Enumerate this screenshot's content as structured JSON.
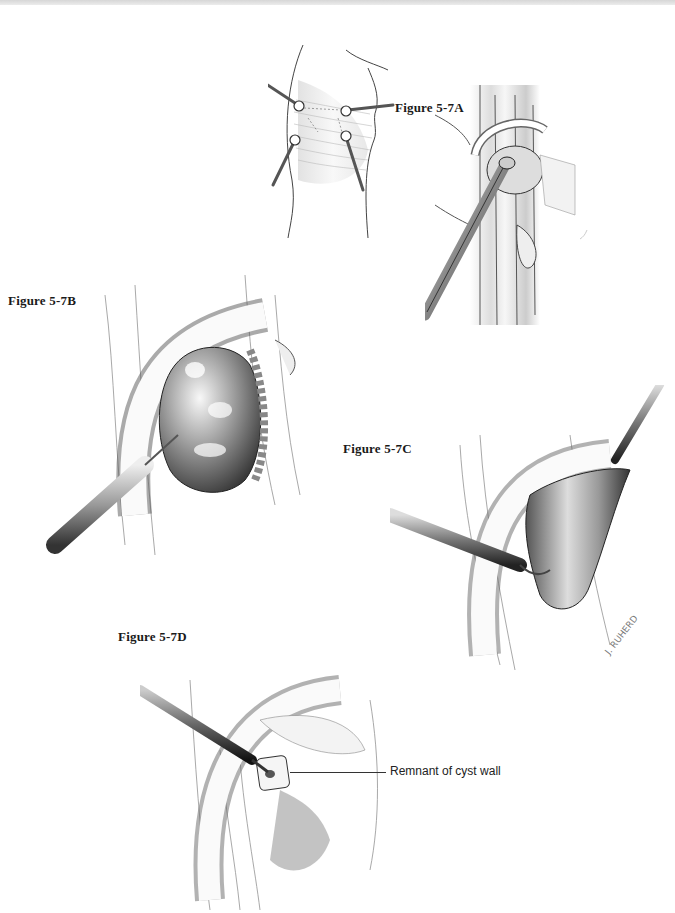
{
  "page": {
    "background": "#ffffff",
    "line_color": "#333333"
  },
  "figures": [
    {
      "id": "5-7A",
      "label": "Figure 5-7A",
      "description": "Knee with four arthroscopic portals; arthroscope introduced into popliteal cyst"
    },
    {
      "id": "5-7B",
      "label": "Figure 5-7B",
      "description": "Needle aspiration of distended cyst under arthroscopic view"
    },
    {
      "id": "5-7C",
      "label": "Figure 5-7C",
      "description": "Grasper and shaver excising the collapsed cyst wall"
    },
    {
      "id": "5-7D",
      "label": "Figure 5-7D",
      "description": "Shaver debriding remnant of cyst wall"
    }
  ],
  "annotations": {
    "callout_5_7D": "Remnant of cyst wall",
    "artist_signature": "J. RUHERD"
  }
}
